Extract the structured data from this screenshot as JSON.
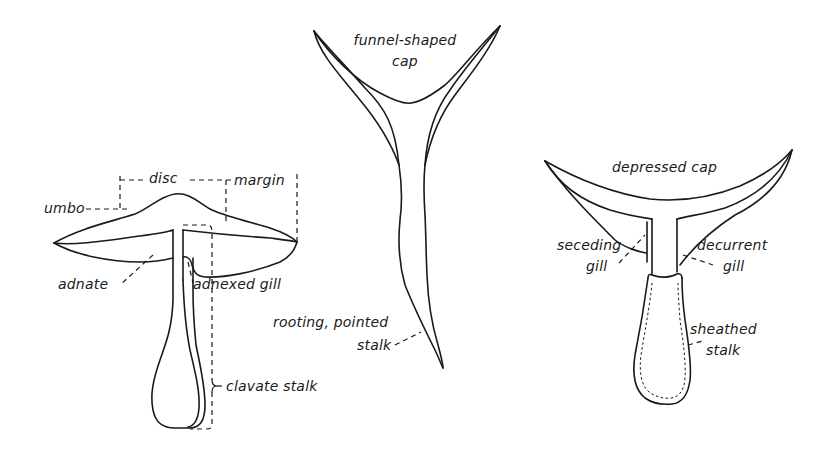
{
  "diagram": {
    "colors": {
      "ink": "#1a1a1a",
      "background": "#ffffff"
    },
    "figures": [
      {
        "id": "left-mushroom",
        "labels": {
          "disc": "disc",
          "margin": "margin",
          "umbo": "umbo",
          "adnate": "adnate",
          "adnexed_gill": "adnexed gill",
          "clavate_stalk": "clavate stalk"
        }
      },
      {
        "id": "center-mushroom",
        "labels": {
          "cap_line1": "funnel-shaped",
          "cap_line2": "cap",
          "stalk_line1": "rooting, pointed",
          "stalk_line2": "stalk"
        }
      },
      {
        "id": "right-mushroom",
        "labels": {
          "cap": "depressed cap",
          "seceding_line1": "seceding",
          "seceding_line2": "gill",
          "decurrent_line1": "decurrent",
          "decurrent_line2": "gill",
          "sheathed_line1": "sheathed",
          "sheathed_line2": "stalk"
        }
      }
    ]
  }
}
